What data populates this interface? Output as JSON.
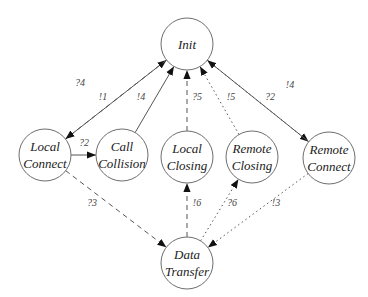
{
  "diagram": {
    "type": "state-transition-diagram",
    "node_radius": 26,
    "nodes": [
      {
        "id": "init",
        "lines": [
          "Init"
        ],
        "x": 187,
        "y": 44
      },
      {
        "id": "local_connect",
        "lines": [
          "Local",
          "Connect"
        ],
        "x": 45,
        "y": 155
      },
      {
        "id": "call_collision",
        "lines": [
          "Call",
          "Collision"
        ],
        "x": 122,
        "y": 155
      },
      {
        "id": "local_closing",
        "lines": [
          "Local",
          "Closing"
        ],
        "x": 187,
        "y": 157
      },
      {
        "id": "remote_closing",
        "lines": [
          "Remote",
          "Closing"
        ],
        "x": 252,
        "y": 157
      },
      {
        "id": "remote_connect",
        "lines": [
          "Remote",
          "Connect"
        ],
        "x": 329,
        "y": 158
      },
      {
        "id": "data_transfer",
        "lines": [
          "Data",
          "Transfer"
        ],
        "x": 187,
        "y": 263
      }
    ],
    "edges": [
      {
        "from": "local_connect",
        "to": "init",
        "style": "solid",
        "label": "?4",
        "lx": 80,
        "ly": 86
      },
      {
        "from": "init",
        "to": "local_connect",
        "style": "dashed",
        "label": "!1",
        "lx": 103,
        "ly": 100
      },
      {
        "from": "call_collision",
        "to": "init",
        "style": "solid",
        "label": "!4",
        "lx": 141,
        "ly": 100
      },
      {
        "from": "local_closing",
        "to": "init",
        "style": "dashed",
        "label": "?5",
        "lx": 197,
        "ly": 100
      },
      {
        "from": "remote_closing",
        "to": "init",
        "style": "dotted",
        "label": "!5",
        "lx": 231,
        "ly": 100
      },
      {
        "from": "init",
        "to": "remote_connect",
        "style": "dotted",
        "label": "?2",
        "lx": 270,
        "ly": 100
      },
      {
        "from": "remote_connect",
        "to": "init",
        "style": "solid",
        "label": "!4",
        "lx": 290,
        "ly": 88
      },
      {
        "from": "local_connect",
        "to": "call_collision",
        "style": "solid",
        "label": "?2",
        "lx": 84,
        "ly": 146
      },
      {
        "from": "local_connect",
        "to": "data_transfer",
        "style": "dashed",
        "label": "?3",
        "lx": 92,
        "ly": 206
      },
      {
        "from": "data_transfer",
        "to": "local_closing",
        "style": "dashed",
        "label": "!6",
        "lx": 197,
        "ly": 206
      },
      {
        "from": "data_transfer",
        "to": "remote_closing",
        "style": "dotted",
        "label": "?6",
        "lx": 232,
        "ly": 206
      },
      {
        "from": "remote_connect",
        "to": "data_transfer",
        "style": "dotted",
        "label": "!3",
        "lx": 276,
        "ly": 206
      }
    ]
  }
}
